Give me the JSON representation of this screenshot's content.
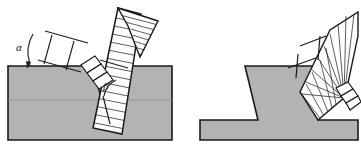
{
  "figure": {
    "background_color": "#ffffff",
    "width": 361,
    "height": 151,
    "colors": {
      "workpiece_fill": "#b3b3b3",
      "workpiece_edge": "#1a1a1a",
      "electrode_fill": "#ffffff",
      "electrode_edge": "#1a1a1a",
      "hatch_line": "#1a1a1a",
      "label_color": "#1a1a1a"
    },
    "panels": [
      {
        "id": "left-panel",
        "name": "single-pass-electrode-angles",
        "description": "Electrode held at angle alpha from vertical over a V-groove joint of included angle beta",
        "labels": [
          {
            "id": "alpha",
            "text": "α",
            "x": 20,
            "y": 50,
            "meaning": "electrode tilt angle from vertical"
          },
          {
            "id": "beta",
            "text": "β",
            "x": 105,
            "y": 90,
            "meaning": "groove bevel angle"
          }
        ]
      },
      {
        "id": "right-panel",
        "name": "weaving-electrode-fan-motion",
        "description": "Electrode swept through a fan of positions showing weave motion on a T-profile joint",
        "labels": []
      }
    ]
  }
}
